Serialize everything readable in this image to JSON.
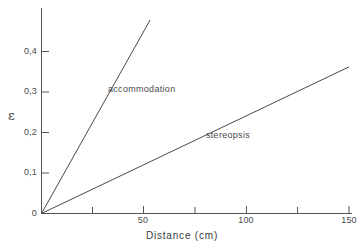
{
  "chart_data": {
    "type": "line",
    "title": "",
    "xlabel": "Distance (cm)",
    "ylabel": "ε",
    "xlim": [
      0,
      158
    ],
    "ylim": [
      0,
      0.5
    ],
    "grid": false,
    "legend_position": "inline-annotations",
    "x_ticks": [
      0,
      25,
      50,
      75,
      100,
      125,
      150
    ],
    "x_tick_labels": [
      "0",
      "",
      "50",
      "",
      "100",
      "",
      "150"
    ],
    "y_ticks": [
      0,
      0.1,
      0.2,
      0.3,
      0.4
    ],
    "y_tick_labels": [
      "0",
      "0,1",
      "0,2",
      "0,3",
      "0,4"
    ],
    "series": [
      {
        "name": "accommodation",
        "x": [
          0,
          53
        ],
        "y": [
          0,
          0.478
        ],
        "slope": 0.00902,
        "color": "#4a4a4a"
      },
      {
        "name": "stereopsis",
        "x": [
          0,
          150
        ],
        "y": [
          0,
          0.362
        ],
        "slope": 0.00241,
        "color": "#4a4a4a"
      }
    ],
    "annotations": [
      {
        "text": "accommodation",
        "x": 33,
        "y": 0.305
      },
      {
        "text": "stereopsis",
        "x": 80,
        "y": 0.205
      }
    ]
  },
  "axes": {
    "y_title": "ε",
    "x_title": "Distance (cm)",
    "y_tick_0": "0",
    "y_tick_1": "0,1",
    "y_tick_2": "0,2",
    "y_tick_3": "0,3",
    "y_tick_4": "0,4",
    "x_tick_0": "0",
    "x_tick_50": "50",
    "x_tick_100": "100",
    "x_tick_150": "150"
  },
  "labels": {
    "accommodation": "accommodation",
    "stereopsis": "stereopsis"
  },
  "colors": {
    "background": "#ffffff",
    "axis": "#555555",
    "line": "#4a4a4a",
    "text": "#3a3a3a"
  }
}
